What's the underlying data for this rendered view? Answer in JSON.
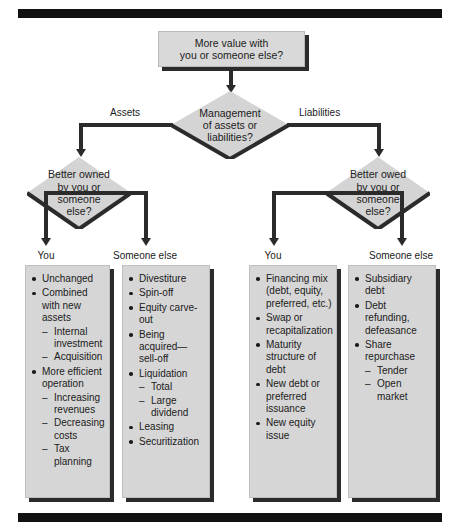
{
  "diagram": {
    "colors": {
      "node_fill": "#d9d9d9",
      "box_fill": "#d6d6d6",
      "shadow": "#2b2b2b",
      "rule": "#111111",
      "text": "#1b1b1b"
    },
    "root": {
      "label": "More value with\nyou or someone else?",
      "line1": "More value with",
      "line2": "you or someone else?"
    },
    "decision_main": {
      "line1": "Management",
      "line2": "of assets or",
      "line3": "liabilities?"
    },
    "branch_labels": {
      "left": "Assets",
      "right": "Liabilities"
    },
    "decision_left": {
      "line1": "Better owned",
      "line2": "by you or",
      "line3": "someone",
      "line4": "else?"
    },
    "decision_right": {
      "line1": "Better owed",
      "line2": "by you or",
      "line3": "someone",
      "line4": "else?"
    },
    "column_labels": {
      "c1": "You",
      "c2": "Someone else",
      "c3": "You",
      "c4": "Someone else"
    },
    "columns": [
      {
        "id": "assets-you",
        "label": "You",
        "items": [
          {
            "text": "Unchanged",
            "sub": []
          },
          {
            "text": "Combined with new assets",
            "sub": [
              "Internal investment",
              "Acquisition"
            ]
          },
          {
            "text": "More efficient operation",
            "sub": [
              "Increasing revenues",
              "Decreasing costs",
              "Tax planning"
            ]
          }
        ]
      },
      {
        "id": "assets-someone-else",
        "label": "Someone else",
        "items": [
          {
            "text": "Divestiture",
            "sub": []
          },
          {
            "text": "Spin-off",
            "sub": []
          },
          {
            "text": "Equity carve-out",
            "sub": []
          },
          {
            "text": "Being acquired—sell-off",
            "sub": []
          },
          {
            "text": "Liquidation",
            "sub": [
              "Total",
              "Large dividend"
            ]
          },
          {
            "text": "Leasing",
            "sub": []
          },
          {
            "text": "Securitization",
            "sub": []
          }
        ]
      },
      {
        "id": "liabilities-you",
        "label": "You",
        "items": [
          {
            "text": "Financing mix (debt, equity, preferred, etc.)",
            "sub": []
          },
          {
            "text": "Swap or recapitalization",
            "sub": []
          },
          {
            "text": "Maturity structure of debt",
            "sub": []
          },
          {
            "text": "New debt or preferred issuance",
            "sub": []
          },
          {
            "text": "New equity issue",
            "sub": []
          }
        ]
      },
      {
        "id": "liabilities-someone-else",
        "label": "Someone else",
        "items": [
          {
            "text": "Subsidiary debt",
            "sub": []
          },
          {
            "text": "Debt refunding, defeasance",
            "sub": []
          },
          {
            "text": "Share repurchase",
            "sub": [
              "Tender",
              "Open market"
            ]
          }
        ]
      }
    ]
  }
}
